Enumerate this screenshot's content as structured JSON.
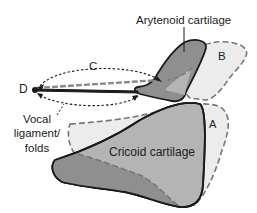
{
  "diagram": {
    "type": "anatomical",
    "labels": {
      "arytenoid": "Arytenoid cartilage",
      "cricoid": "Cricoid cartilage",
      "vocal_line1": "Vocal",
      "vocal_line2": "ligament/",
      "vocal_line3": "folds",
      "a": "A",
      "b": "B",
      "c": "C",
      "d": "D"
    },
    "colors": {
      "cartilage_dark": "#8f8f8f",
      "cartilage_mid": "#b4b4b4",
      "ghost_fill": "#ececec",
      "outline": "#1a1a1a",
      "dashed": "#777777"
    }
  }
}
